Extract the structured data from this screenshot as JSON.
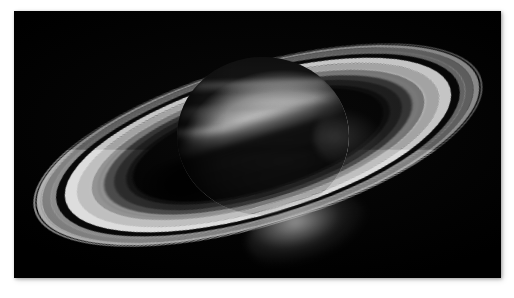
{
  "page": {
    "background_color": "#ffffff",
    "type": "astronomical-photograph",
    "color_mode": "grayscale"
  },
  "photo": {
    "alt": "Saturn and its ring system in grayscale",
    "background_color": "#000000",
    "x": 14,
    "y": 11,
    "width": 487,
    "height": 267,
    "border": "none",
    "shadow": true
  },
  "scene": {
    "planet": {
      "name": "Saturn",
      "highlight_color": "#ffffff",
      "midtone_color": "#bdbdbd",
      "terminator_color": "#151515",
      "bands": [
        "north-polar-hood",
        "north-equatorial-belt",
        "equatorial-zone",
        "equatorial-belt",
        "south-temperate-belt"
      ]
    },
    "rings": {
      "tilt_degrees": -16.5,
      "bands": [
        {
          "name": "F-ring-haze",
          "color": "#d7d7d7",
          "brightness": "faint"
        },
        {
          "name": "A-ring-outer",
          "color": "#c4c4c4",
          "brightness": "bright"
        },
        {
          "name": "Encke-gap",
          "color": "#0a0a0a",
          "brightness": "dark"
        },
        {
          "name": "A-ring-mid",
          "color": "#969696",
          "brightness": "medium"
        },
        {
          "name": "A-ring-inner",
          "color": "#a8a8a8",
          "brightness": "medium"
        },
        {
          "name": "Cassini-Division",
          "color": "#080808",
          "brightness": "dark"
        },
        {
          "name": "B-ring-outer",
          "color": "#e0e0e0",
          "brightness": "brightest"
        },
        {
          "name": "B-ring-mid",
          "color": "#c6c6c6",
          "brightness": "bright"
        },
        {
          "name": "B-ring-inner",
          "color": "#a0a0a0",
          "brightness": "medium"
        },
        {
          "name": "C-ring-outer",
          "color": "#606060",
          "brightness": "dim"
        },
        {
          "name": "C-ring-inner",
          "color": "#404040",
          "brightness": "dim"
        },
        {
          "name": "D-ring-haze",
          "color": "#282828",
          "brightness": "very-faint"
        }
      ]
    },
    "shadows": {
      "ring_shadow_on_planet": true,
      "planet_shadow_on_rings": true,
      "south_crescent_visible": true
    }
  }
}
